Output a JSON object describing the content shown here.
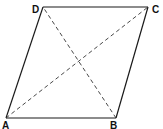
{
  "diagram": {
    "shape": "parallelogram",
    "vertices": {
      "A": {
        "label": "A",
        "x": 6,
        "y": 118
      },
      "B": {
        "label": "B",
        "x": 116,
        "y": 118
      },
      "C": {
        "label": "C",
        "x": 148,
        "y": 7
      },
      "D": {
        "label": "D",
        "x": 43,
        "y": 7
      }
    },
    "sides": [
      {
        "from": "A",
        "to": "B",
        "style": "solid"
      },
      {
        "from": "B",
        "to": "C",
        "style": "solid"
      },
      {
        "from": "C",
        "to": "D",
        "style": "solid"
      },
      {
        "from": "D",
        "to": "A",
        "style": "solid"
      }
    ],
    "diagonals": [
      {
        "from": "A",
        "to": "C",
        "style": "dashed"
      },
      {
        "from": "B",
        "to": "D",
        "style": "dashed"
      }
    ],
    "colors": {
      "line": "#1a1a1a",
      "dashed": "#333333",
      "background": "#ffffff"
    }
  }
}
